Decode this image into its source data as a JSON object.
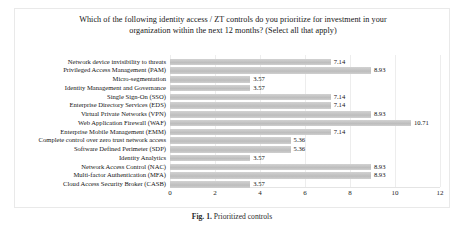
{
  "figure": {
    "title_line1": "Which of the following identity access / ZT controls do you prioritize for investment in your",
    "title_line2": "organization within the next 12 months? (Select all that apply)",
    "caption_label": "Fig. 1.",
    "caption_text": "Prioritized controls"
  },
  "chart_data": {
    "type": "bar",
    "orientation": "horizontal",
    "title": "Which of the following identity access / ZT controls do you prioritize for investment in your organization within the next 12 months? (Select all that apply)",
    "xlabel": "",
    "ylabel": "",
    "xlim": [
      0,
      12
    ],
    "xticks": [
      "0",
      "2",
      "4",
      "6",
      "8",
      "10",
      "12"
    ],
    "grid": true,
    "legend": false,
    "bar_color": "#c8c8c8",
    "categories": [
      "Network device invisibility to threats",
      "Privileged Access Management (PAM)",
      "Micro-segmentation",
      "Identity Management and Governance",
      "Single Sign-On (SSO)",
      "Enterprise Directory Services (EDS)",
      "Virtual Private Networks (VPN)",
      "Web Application Firewall (WAF)",
      "Enterprise Mobile Management (EMM)",
      "Complete control over zero trust network access",
      "Software Defined Perimeter (SDP)",
      "Identity Analytics",
      "Network Access Control (NAC)",
      "Multi-factor Authentication (MFA)",
      "Cloud Access Security Broker (CASB)"
    ],
    "values": [
      7.14,
      8.93,
      3.57,
      3.57,
      7.14,
      7.14,
      8.93,
      10.71,
      7.14,
      5.36,
      5.36,
      3.57,
      8.93,
      8.93,
      3.57
    ],
    "value_labels": [
      "7.14",
      "8.93",
      "3.57",
      "3.57",
      "7.14",
      "7.14",
      "8.93",
      "10.71",
      "7.14",
      "5.36",
      "5.36",
      "3.57",
      "8.93",
      "8.93",
      "3.57"
    ]
  }
}
